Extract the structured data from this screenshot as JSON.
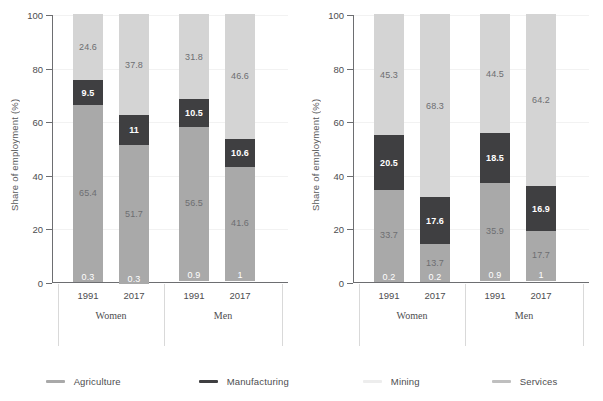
{
  "chart_data": {
    "type": "bar",
    "subtype": "stacked-column-100pct",
    "panels": [
      {
        "name": "left",
        "ylabel": "Share of employment (%)",
        "ylim": [
          0,
          100
        ],
        "yticks": [
          0,
          20,
          40,
          60,
          80,
          100
        ],
        "grid": true,
        "categories": [
          "1991",
          "2017",
          "1991",
          "2017"
        ],
        "groups": [
          {
            "label": "Women",
            "categories": [
              "1991",
              "2017"
            ]
          },
          {
            "label": "Men",
            "categories": [
              "1991",
              "2017"
            ]
          }
        ],
        "series": [
          {
            "name": "Agriculture",
            "values": [
              0.3,
              0.3,
              0.9,
              1.0
            ]
          },
          {
            "name": "Mining",
            "values": [
              65.4,
              51.7,
              56.5,
              41.6
            ]
          },
          {
            "name": "Manufacturing",
            "values": [
              9.5,
              11.0,
              10.5,
              10.6
            ]
          },
          {
            "name": "Services",
            "values": [
              24.6,
              37.8,
              31.8,
              46.6
            ]
          }
        ]
      },
      {
        "name": "right",
        "ylabel": "Share of employment (%)",
        "ylim": [
          0,
          100
        ],
        "yticks": [
          0,
          20,
          40,
          60,
          80,
          100
        ],
        "grid": true,
        "categories": [
          "1991",
          "2017",
          "1991",
          "2017"
        ],
        "groups": [
          {
            "label": "Women",
            "categories": [
              "1991",
              "2017"
            ]
          },
          {
            "label": "Men",
            "categories": [
              "1991",
              "2017"
            ]
          }
        ],
        "series": [
          {
            "name": "Agriculture",
            "values": [
              0.2,
              0.2,
              0.9,
              1.0
            ]
          },
          {
            "name": "Mining",
            "values": [
              33.7,
              13.7,
              35.9,
              17.7
            ]
          },
          {
            "name": "Manufacturing",
            "values": [
              20.5,
              17.6,
              18.5,
              16.9
            ]
          },
          {
            "name": "Services",
            "values": [
              45.3,
              68.3,
              44.5,
              64.2
            ]
          }
        ]
      }
    ],
    "legend": {
      "position": "bottom",
      "entries": [
        {
          "label": "Agriculture",
          "color": "#a9a9a9"
        },
        {
          "label": "Manufacturing",
          "color": "#3f3f41"
        },
        {
          "label": "Mining",
          "color": "#ededed"
        },
        {
          "label": "Services",
          "color": "#bfbfbf"
        }
      ]
    },
    "colors": {
      "agriculture": "#a9a9a9",
      "mining": "#a9a9a9",
      "manufacturing": "#3f3f41",
      "services": "#d4d4d4",
      "axis": "#6d6e71",
      "text": "#4d4d4f",
      "grid": "#f2f2f2",
      "label_on_dark": "#ffffff",
      "label_on_light": "#6d6e71",
      "background": "#ffffff"
    }
  }
}
